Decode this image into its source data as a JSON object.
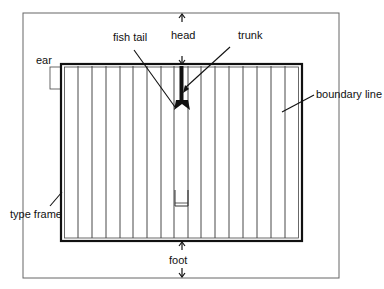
{
  "diagram": {
    "type": "page-layout anatomy",
    "labels": {
      "ear": "ear",
      "fish_tail": "fish tail",
      "head": "head",
      "trunk": "trunk",
      "boundary_line": "boundary line",
      "type_frame": "type frame",
      "foot": "foot"
    },
    "colors": {
      "line": "#222222",
      "outer_frame": "#555555",
      "background": "#ffffff"
    },
    "geometry": {
      "outer_frame": {
        "x": 23,
        "y": 13,
        "w": 316,
        "h": 265
      },
      "type_frame": {
        "x": 61,
        "y": 64,
        "w": 241,
        "h": 177
      },
      "column_spacing": 14
    }
  }
}
